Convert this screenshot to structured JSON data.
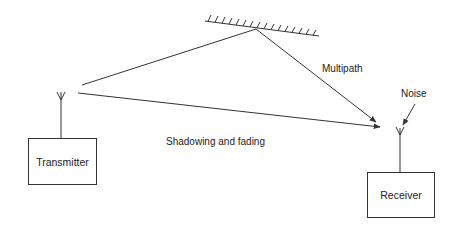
{
  "diagram": {
    "nodes": {
      "transmitter": {
        "label": "Transmitter"
      },
      "receiver": {
        "label": "Receiver"
      },
      "reflector": {
        "label": ""
      }
    },
    "labels": {
      "multipath": "Multipath",
      "noise": "Noise",
      "shadowing": "Shadowing and fading"
    },
    "edges": [
      {
        "from": "transmitter",
        "to": "reflector",
        "label": ""
      },
      {
        "from": "reflector",
        "to": "receiver",
        "label": "Multipath"
      },
      {
        "from": "transmitter",
        "to": "receiver",
        "label": "Shadowing and fading"
      },
      {
        "from": "noise",
        "to": "receiver",
        "label": "Noise"
      }
    ],
    "colors": {
      "stroke": "#333333",
      "text": "#222222",
      "background": "#ffffff"
    }
  }
}
